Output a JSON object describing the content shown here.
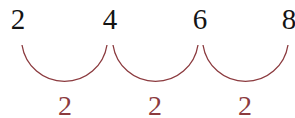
{
  "diagram": {
    "type": "skip-counting number line",
    "numbers": [
      "2",
      "4",
      "6",
      "8"
    ],
    "steps": [
      "2",
      "2",
      "2"
    ],
    "colors": {
      "numbers": "#141414",
      "arcs": "#8b3a3e",
      "steps": "#8b3a3e"
    }
  }
}
